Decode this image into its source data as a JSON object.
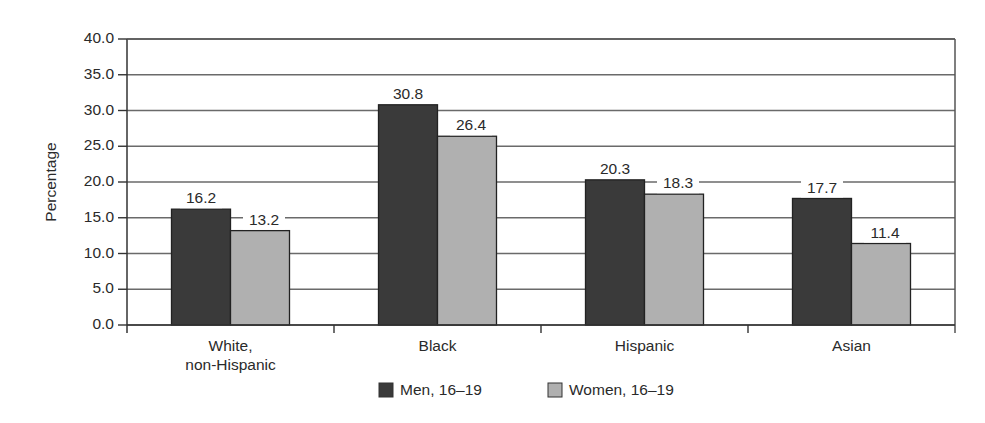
{
  "chart_data": {
    "type": "bar",
    "title": "",
    "xlabel": "",
    "ylabel": "Percentage",
    "ylim": [
      0,
      40
    ],
    "y_ticks": [
      "0.0",
      "5.0",
      "10.0",
      "15.0",
      "20.0",
      "25.0",
      "30.0",
      "35.0",
      "40.0"
    ],
    "grid": true,
    "legend_position": "bottom",
    "categories": [
      [
        "White,",
        "non-Hispanic"
      ],
      [
        "Black"
      ],
      [
        "Hispanic"
      ],
      [
        "Asian"
      ]
    ],
    "series": [
      {
        "name": "Men, 16–19",
        "color": "#3a3a3a",
        "values": [
          16.2,
          30.8,
          20.3,
          17.7
        ]
      },
      {
        "name": "Women, 16–19",
        "color": "#b0b0b0",
        "values": [
          13.2,
          26.4,
          18.3,
          11.4
        ]
      }
    ]
  }
}
